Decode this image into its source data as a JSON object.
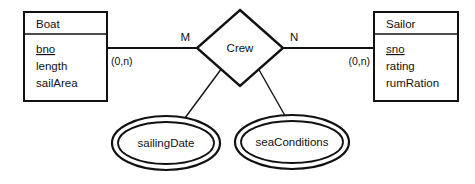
{
  "diagram": {
    "type": "entity-relationship-diagram",
    "notation": "Chen",
    "background_color": "#ffffff",
    "stroke_color": "#111111",
    "entities": [
      {
        "id": "boat",
        "name": "Boat",
        "attributes": [
          {
            "label": "bno",
            "key": true
          },
          {
            "label": "length",
            "key": false
          },
          {
            "label": "sailArea",
            "key": false
          }
        ]
      },
      {
        "id": "sailor",
        "name": "Sailor",
        "attributes": [
          {
            "label": "sno",
            "key": true
          },
          {
            "label": "rating",
            "key": false
          },
          {
            "label": "rumRation",
            "key": false
          }
        ]
      }
    ],
    "relationship": {
      "id": "crew",
      "name": "Crew",
      "left_degree": "M",
      "right_degree": "N",
      "left_cardinality": "(0,n)",
      "right_cardinality": "(0,n)"
    },
    "relationship_attributes": [
      {
        "id": "sailing-date",
        "label": "sailingDate",
        "multivalued": true
      },
      {
        "id": "sea-conditions",
        "label": "seaConditions",
        "multivalued": true
      }
    ]
  }
}
